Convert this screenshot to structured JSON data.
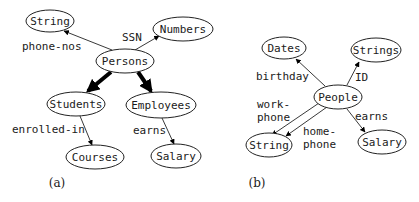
{
  "panels": [
    {
      "caption": "(a)",
      "nodes": {
        "string": "String",
        "numbers": "Numbers",
        "persons": "Persons",
        "students": "Students",
        "employees": "Employees",
        "courses": "Courses",
        "salary": "Salary"
      },
      "edges": {
        "phone_nos": "phone-nos",
        "ssn": "SSN",
        "enrolled_in": "enrolled-in",
        "earns": "earns"
      },
      "edge_list": [
        {
          "from": "Persons",
          "to": "String",
          "label": "phone-nos",
          "style": "thin"
        },
        {
          "from": "Persons",
          "to": "Numbers",
          "label": "SSN",
          "style": "thin"
        },
        {
          "from": "Persons",
          "to": "Students",
          "label": "",
          "style": "thick"
        },
        {
          "from": "Persons",
          "to": "Employees",
          "label": "",
          "style": "thick"
        },
        {
          "from": "Students",
          "to": "Courses",
          "label": "enrolled-in",
          "style": "thin"
        },
        {
          "from": "Employees",
          "to": "Salary",
          "label": "earns",
          "style": "thin"
        }
      ]
    },
    {
      "caption": "(b)",
      "nodes": {
        "dates": "Dates",
        "strings": "Strings",
        "people": "People",
        "string": "String",
        "salary": "Salary"
      },
      "edges": {
        "birthday": "birthday",
        "id": "ID",
        "work_phone_1": "work-",
        "work_phone_2": "phone",
        "home_phone_1": "home-",
        "home_phone_2": "phone",
        "earns": "earns"
      },
      "edge_list": [
        {
          "from": "People",
          "to": "Dates",
          "label": "birthday",
          "style": "thin"
        },
        {
          "from": "People",
          "to": "Strings",
          "label": "ID",
          "style": "thin"
        },
        {
          "from": "People",
          "to": "String",
          "label": "work-phone",
          "style": "thin"
        },
        {
          "from": "People",
          "to": "String",
          "label": "home-phone",
          "style": "thin"
        },
        {
          "from": "People",
          "to": "Salary",
          "label": "earns",
          "style": "thin"
        }
      ]
    }
  ]
}
